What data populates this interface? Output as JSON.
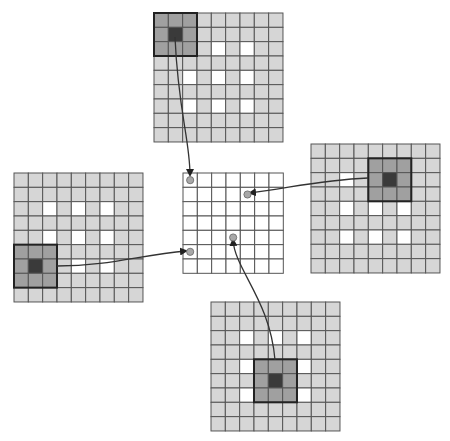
{
  "diagram": {
    "cell_size": 14.33,
    "colors": {
      "background": "#ffffff",
      "cell_light": "#d6d6d6",
      "cell_white": "#ffffff",
      "kernel_medium": "#a0a0a0",
      "kernel_center": "#3a3a3a",
      "grid_line": "#555555",
      "kernel_border": "#222222",
      "output_dot": "#a8a8a8",
      "arrow": "#333333"
    },
    "output_grid": {
      "name": "output-grid-center",
      "x": 183,
      "y": 173,
      "rows": 7,
      "cols": 7,
      "dots": [
        {
          "name": "output-dot-top",
          "col": 0,
          "row": 0
        },
        {
          "name": "output-dot-right",
          "col": 4,
          "row": 1
        },
        {
          "name": "output-dot-bottom",
          "col": 3,
          "row": 4
        },
        {
          "name": "output-dot-left",
          "col": 0,
          "row": 5
        }
      ]
    },
    "input_grids": [
      {
        "name": "input-grid-top",
        "x": 154,
        "y": 13,
        "rows": 9,
        "cols": 9,
        "white_cells": [
          [
            4,
            2
          ],
          [
            6,
            2
          ],
          [
            2,
            4
          ],
          [
            4,
            4
          ],
          [
            6,
            4
          ],
          [
            2,
            6
          ],
          [
            4,
            6
          ],
          [
            6,
            6
          ]
        ],
        "kernel": {
          "col": 0,
          "row": 0,
          "center_col": 1,
          "center_row": 1
        },
        "arrow": {
          "from": [
            175,
            37
          ],
          "c1": [
            178,
            110
          ],
          "c2": [
            190,
            140
          ],
          "to": [
            190,
            175
          ]
        }
      },
      {
        "name": "input-grid-right",
        "x": 311,
        "y": 144,
        "rows": 9,
        "cols": 9,
        "white_cells": [
          [
            2,
            2
          ],
          [
            2,
            4
          ],
          [
            4,
            4
          ],
          [
            6,
            4
          ],
          [
            2,
            6
          ],
          [
            4,
            6
          ],
          [
            6,
            6
          ]
        ],
        "kernel": {
          "col": 4,
          "row": 1,
          "center_col": 5,
          "center_row": 2
        },
        "arrow": {
          "from": [
            368,
            178
          ],
          "c1": [
            320,
            180
          ],
          "c2": [
            290,
            188
          ],
          "to": [
            250,
            193
          ]
        }
      },
      {
        "name": "input-grid-left",
        "x": 14,
        "y": 173,
        "rows": 9,
        "cols": 9,
        "white_cells": [
          [
            2,
            2
          ],
          [
            4,
            2
          ],
          [
            6,
            2
          ],
          [
            2,
            4
          ],
          [
            4,
            4
          ],
          [
            6,
            4
          ],
          [
            4,
            6
          ],
          [
            6,
            6
          ]
        ],
        "kernel": {
          "col": 0,
          "row": 5,
          "center_col": 1,
          "center_row": 6
        },
        "arrow": {
          "from": [
            57,
            266
          ],
          "c1": [
            110,
            266
          ],
          "c2": [
            140,
            255
          ],
          "to": [
            186,
            251
          ]
        }
      },
      {
        "name": "input-grid-bottom",
        "x": 211,
        "y": 302,
        "rows": 9,
        "cols": 9,
        "white_cells": [
          [
            2,
            2
          ],
          [
            4,
            2
          ],
          [
            6,
            2
          ],
          [
            2,
            4
          ],
          [
            6,
            4
          ],
          [
            2,
            6
          ],
          [
            6,
            6
          ]
        ],
        "kernel": {
          "col": 3,
          "row": 4,
          "center_col": 4,
          "center_row": 5
        },
        "arrow": {
          "from": [
            275,
            360
          ],
          "c1": [
            270,
            300
          ],
          "c2": [
            235,
            270
          ],
          "to": [
            233,
            240
          ]
        }
      }
    ]
  }
}
